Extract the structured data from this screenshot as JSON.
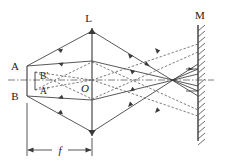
{
  "figure": {
    "type": "optical-ray-diagram",
    "background_color": "#ffffff",
    "ink_color": "#3a3a3a",
    "label_color": "#1a1a1a"
  },
  "labels": {
    "lens": "L",
    "mirror": "M",
    "object_top": "A",
    "object_bottom": "B",
    "image_top": "B′",
    "image_bottom": "A′",
    "lens_center": "O",
    "focal_length": "f"
  },
  "elements": {
    "lens": {
      "name": "L",
      "x": 92,
      "y_top": 28,
      "y_bottom": 136,
      "style": "solid-double-arrow-vertical"
    },
    "mirror": {
      "name": "M",
      "x": 198,
      "y_top": 25,
      "y_bottom": 141,
      "hatch_side": "right",
      "hatch_count": 19
    },
    "optical_axis": {
      "y": 80,
      "x_start": 8,
      "x_end": 214,
      "style": "dash-dot"
    },
    "object": {
      "x": 27,
      "y_top": 66,
      "y_bottom": 96,
      "label_top": "A",
      "label_bottom": "B"
    },
    "image": {
      "x": 35,
      "y_top": 72,
      "y_bottom": 90,
      "label_top": "B′",
      "label_bottom": "A′"
    },
    "focus_point": {
      "x": 172,
      "y": 80
    },
    "dimension_f": {
      "label": "f",
      "x_start": 27,
      "x_end": 92,
      "y": 150,
      "arrows": "both-ends"
    }
  },
  "rays": {
    "solid_description": "Real rays from object point A through lens to mirror and back",
    "dashed_description": "Rays associated with image points B′ and A′",
    "arrow_direction": "marked mid-segment"
  }
}
